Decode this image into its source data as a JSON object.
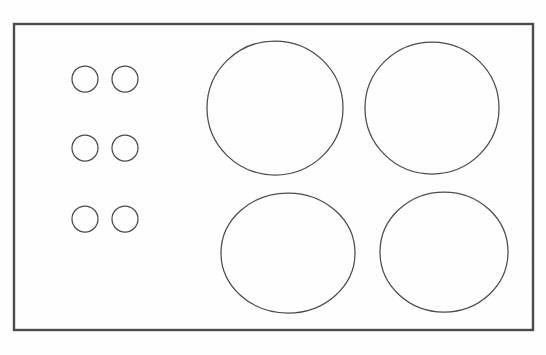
{
  "diagram": {
    "type": "technical-line-drawing",
    "canvas": {
      "width": 546,
      "height": 355
    },
    "background_color": "#ffffff",
    "stroke_color": "#4a4a52",
    "panel": {
      "name": "cooktop-panel",
      "shape": "rectangle",
      "x": 14,
      "y": 24,
      "width": 519,
      "height": 306,
      "stroke_width": 2.4,
      "fill": "#ffffff"
    },
    "burners": [
      {
        "id": "burner-top-left",
        "label": "Top left burner",
        "cx": 275,
        "cy": 108,
        "rx": 68,
        "ry": 67,
        "stroke_width": 1.25
      },
      {
        "id": "burner-top-right",
        "label": "Top right burner",
        "cx": 432,
        "cy": 108,
        "rx": 67,
        "ry": 66,
        "stroke_width": 1.25
      },
      {
        "id": "burner-bottom-left",
        "label": "Bottom left burner",
        "cx": 288,
        "cy": 253,
        "rx": 67,
        "ry": 60,
        "stroke_width": 1.25
      },
      {
        "id": "burner-bottom-right",
        "label": "Bottom right burner",
        "cx": 444,
        "cy": 252,
        "rx": 64,
        "ry": 60,
        "stroke_width": 1.25
      }
    ],
    "knobs": [
      {
        "id": "knob-1",
        "label": "Control knob row 1 left",
        "cx": 85,
        "cy": 79,
        "r": 13,
        "stroke_width": 1.25
      },
      {
        "id": "knob-2",
        "label": "Control knob row 1 right",
        "cx": 125,
        "cy": 79,
        "r": 13,
        "stroke_width": 1.25
      },
      {
        "id": "knob-3",
        "label": "Control knob row 2 left",
        "cx": 85,
        "cy": 148,
        "r": 13,
        "stroke_width": 1.25
      },
      {
        "id": "knob-4",
        "label": "Control knob row 2 right",
        "cx": 125,
        "cy": 148,
        "r": 13,
        "stroke_width": 1.25
      },
      {
        "id": "knob-5",
        "label": "Control knob row 3 left",
        "cx": 85,
        "cy": 219,
        "r": 13,
        "stroke_width": 1.25
      },
      {
        "id": "knob-6",
        "label": "Control knob row 3 right",
        "cx": 125,
        "cy": 219,
        "r": 13,
        "stroke_width": 1.25
      }
    ],
    "counts": {
      "burners": 4,
      "knobs": 6
    }
  }
}
